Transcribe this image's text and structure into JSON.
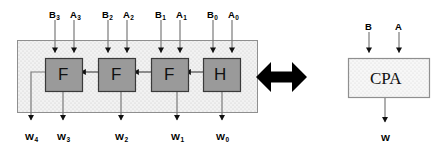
{
  "diagram": {
    "colors": {
      "cell_fill": "#9a9a9a",
      "cell_stroke": "#3a3a3a",
      "container_fill": "#efefef",
      "container_stroke": "#8a8a8a",
      "cpa_fill": "#f4f4f4",
      "cpa_stroke": "#8a8a8a",
      "wire": "#6d6d6d",
      "arrowhead": "#111111",
      "equiv_arrow": "#000000",
      "text": "#000000"
    }
  },
  "left": {
    "name": "ripple-carry-array",
    "cells": [
      {
        "id": "cell-f3",
        "label": "F",
        "x": 45,
        "y": 58,
        "w": 38,
        "h": 34
      },
      {
        "id": "cell-f2",
        "label": "F",
        "x": 98,
        "y": 58,
        "w": 38,
        "h": 34
      },
      {
        "id": "cell-f1",
        "label": "F",
        "x": 151,
        "y": 58,
        "w": 38,
        "h": 34
      },
      {
        "id": "cell-h0",
        "label": "H",
        "x": 203,
        "y": 58,
        "w": 38,
        "h": 34
      }
    ],
    "inputs": [
      {
        "id": "input-b3",
        "label": "B",
        "sub": "3",
        "x": 54,
        "arrow_x": 55
      },
      {
        "id": "input-a3",
        "label": "A",
        "sub": "3",
        "x": 76,
        "arrow_x": 74
      },
      {
        "id": "input-b2",
        "label": "B",
        "sub": "2",
        "x": 107,
        "arrow_x": 108
      },
      {
        "id": "input-a2",
        "label": "A",
        "sub": "2",
        "x": 129,
        "arrow_x": 127
      },
      {
        "id": "input-b1",
        "label": "B",
        "sub": "1",
        "x": 160,
        "arrow_x": 161
      },
      {
        "id": "input-a1",
        "label": "A",
        "sub": "1",
        "x": 182,
        "arrow_x": 180
      },
      {
        "id": "input-b0",
        "label": "B",
        "sub": "0",
        "x": 212,
        "arrow_x": 213
      },
      {
        "id": "input-a0",
        "label": "A",
        "sub": "0",
        "x": 234,
        "arrow_x": 232
      }
    ],
    "outputs": [
      {
        "id": "output-w4",
        "label": "W",
        "sub": "4",
        "x": 31,
        "label_x": 27
      },
      {
        "id": "output-w3",
        "label": "W",
        "sub": "3",
        "x": 63,
        "label_x": 59
      },
      {
        "id": "output-w2",
        "label": "W",
        "sub": "2",
        "x": 121,
        "label_x": 117
      },
      {
        "id": "output-w1",
        "label": "W",
        "sub": "1",
        "x": 177,
        "label_x": 173
      },
      {
        "id": "output-w0",
        "label": "W",
        "sub": "0",
        "x": 222,
        "label_x": 218
      }
    ],
    "container": {
      "x": 17,
      "y": 40,
      "w": 241,
      "h": 73
    }
  },
  "equivalence": {
    "name": "equivalence-double-arrow",
    "symbol": "double-headed-arrow"
  },
  "right": {
    "name": "cpa-block",
    "block": {
      "id": "cpa-box",
      "label": "CPA",
      "x": 348,
      "y": 58,
      "w": 82,
      "h": 40
    },
    "inputs": [
      {
        "id": "input-b",
        "label": "B",
        "x": 369
      },
      {
        "id": "input-a",
        "label": "A",
        "x": 399
      }
    ],
    "outputs": [
      {
        "id": "output-w",
        "label": "W",
        "x": 385
      }
    ]
  }
}
